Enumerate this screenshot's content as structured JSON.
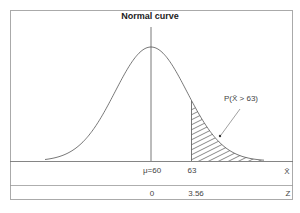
{
  "title": "Normal curve",
  "annotation": "P(X̄ > 63)",
  "axes": {
    "xbar_axis": {
      "symbol": "X̄",
      "ticks": [
        {
          "label": "μ=60",
          "value": 60
        },
        {
          "label": "63",
          "value": 63
        }
      ]
    },
    "z_axis": {
      "symbol": "Z",
      "ticks": [
        {
          "label": "0",
          "value": 0
        },
        {
          "label": "3.56",
          "value": 3.56
        }
      ]
    }
  },
  "colors": {
    "line": "#555555",
    "frame": "#aaaaaa",
    "text": "#444444"
  },
  "shaded_region": "right tail beyond 63"
}
